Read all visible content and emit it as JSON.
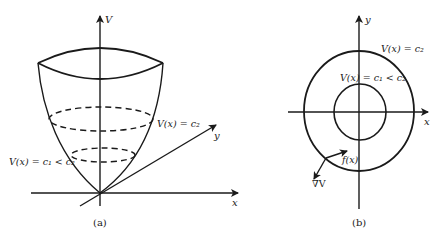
{
  "figure": {
    "panel_a": {
      "caption": "(a)",
      "axes": {
        "vertical": "V",
        "y": "y",
        "x": "x"
      },
      "labels": {
        "level_c2": "V(x) = c₂",
        "level_c1": "V(x) = c₁ < c₂"
      }
    },
    "panel_b": {
      "caption": "(b)",
      "axes": {
        "y": "y",
        "x": "x"
      },
      "labels": {
        "level_c2": "V(x) = c₂",
        "level_c1": "V(x) = c₁ < c₂",
        "vector_field": "f(x)",
        "gradient": "∇V"
      }
    }
  },
  "colors": {
    "stroke": "#1a1a1a",
    "background": "#ffffff"
  }
}
